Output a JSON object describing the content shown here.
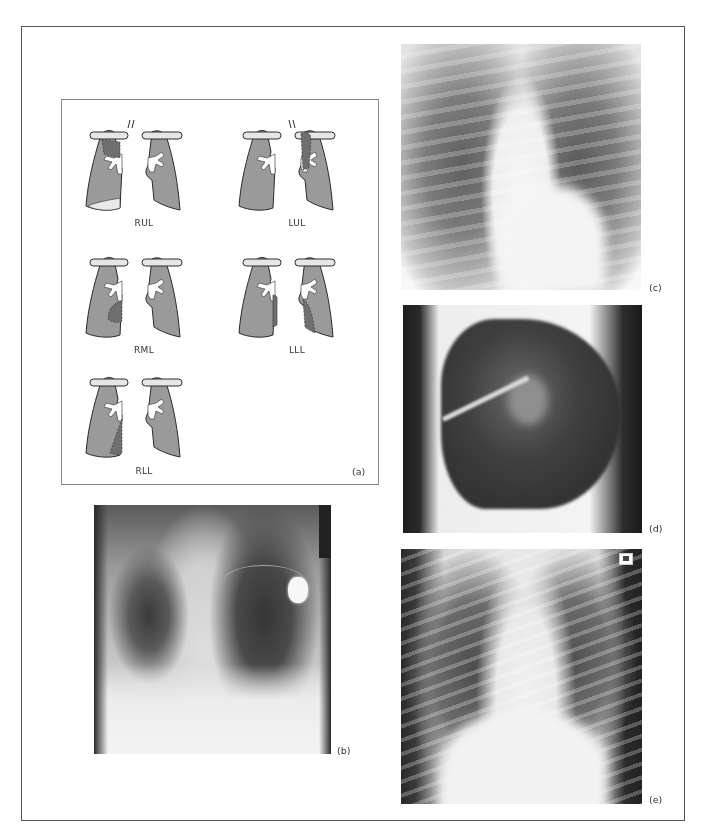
{
  "figure": {
    "panels": [
      {
        "id": "a",
        "label": "(a)",
        "type": "diagram",
        "description": "Lobar collapse patterns"
      },
      {
        "id": "b",
        "label": "(b)",
        "type": "radiograph"
      },
      {
        "id": "c",
        "label": "(c)",
        "type": "radiograph"
      },
      {
        "id": "d",
        "label": "(d)",
        "type": "radiograph"
      },
      {
        "id": "e",
        "label": "(e)",
        "type": "radiograph"
      }
    ],
    "diagram": {
      "lobes": [
        {
          "key": "rul",
          "label": "RUL"
        },
        {
          "key": "lul",
          "label": "LUL"
        },
        {
          "key": "rml",
          "label": "RML"
        },
        {
          "key": "lll",
          "label": "LLL"
        },
        {
          "key": "rll",
          "label": "RLL"
        }
      ],
      "colors": {
        "lung": "#9a9a9a",
        "collapsed": "#7b7b7b",
        "clavicle": "#e6e6e6",
        "outline": "#2b2b2b"
      }
    }
  }
}
